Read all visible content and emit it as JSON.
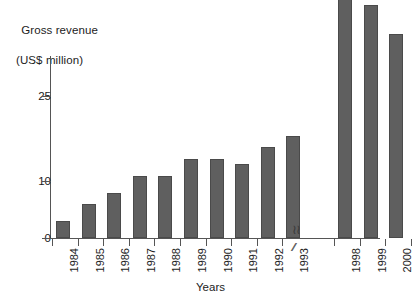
{
  "chart_data": {
    "type": "bar",
    "title": "",
    "ylabel_lines": [
      "Gross revenue",
      "(US$ million)"
    ],
    "ylabel": "Gross revenue (US$ million)",
    "xlabel": "Years",
    "categories": [
      "1984",
      "1985",
      "1986",
      "1987",
      "1988",
      "1989",
      "1990",
      "1991",
      "1992",
      "1993",
      "1998",
      "1999",
      "2000"
    ],
    "values": [
      3,
      6,
      8,
      11,
      11,
      14,
      14,
      13,
      16,
      18,
      45,
      41,
      36
    ],
    "yticks": [
      0,
      10,
      25
    ],
    "ytick_labels": [
      "0",
      "10",
      "25"
    ],
    "ylim": [
      0,
      31
    ],
    "grid": false,
    "legend": null,
    "axis_break": {
      "present": true,
      "symbol": "≀≀",
      "after_category": "1993",
      "before_category": "1998",
      "note": "x-axis break between 1993 and 1998"
    },
    "bar_color": "#5f5f5f",
    "axis_color": "#555555",
    "background": "#ffffff"
  },
  "series_readout": [
    {
      "year": "1984",
      "value": 3
    },
    {
      "year": "1985",
      "value": 6
    },
    {
      "year": "1986",
      "value": 8
    },
    {
      "year": "1987",
      "value": 11
    },
    {
      "year": "1988",
      "value": 11
    },
    {
      "year": "1989",
      "value": 14
    },
    {
      "year": "1990",
      "value": 14
    },
    {
      "year": "1991",
      "value": 13
    },
    {
      "year": "1992",
      "value": 16
    },
    {
      "year": "1993",
      "value": 18
    },
    {
      "year": "1998",
      "value": 45
    },
    {
      "year": "1999",
      "value": 41
    },
    {
      "year": "2000",
      "value": 36
    }
  ]
}
